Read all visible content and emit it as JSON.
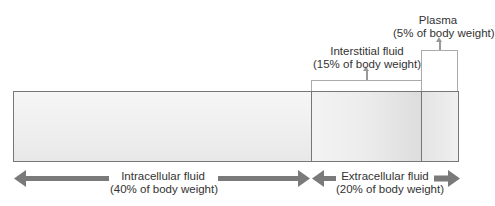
{
  "compartments": {
    "intracellular": {
      "name": "Intracellular fluid",
      "percent_label": "(40% of body weight)",
      "percent": 40
    },
    "extracellular": {
      "name": "Extracellular fluid",
      "percent_label": "(20% of body weight)",
      "percent": 20
    },
    "interstitial": {
      "name": "Interstitial fluid",
      "percent_label": "(15% of body weight)",
      "percent": 15
    },
    "plasma": {
      "name": "Plasma",
      "percent_label": "(5% of body weight)",
      "percent": 5
    }
  },
  "colors": {
    "arrow": "#7a7a7a",
    "border": "#777777",
    "bracket": "#aaaaaa",
    "fill_light": "#f2f2f2"
  }
}
